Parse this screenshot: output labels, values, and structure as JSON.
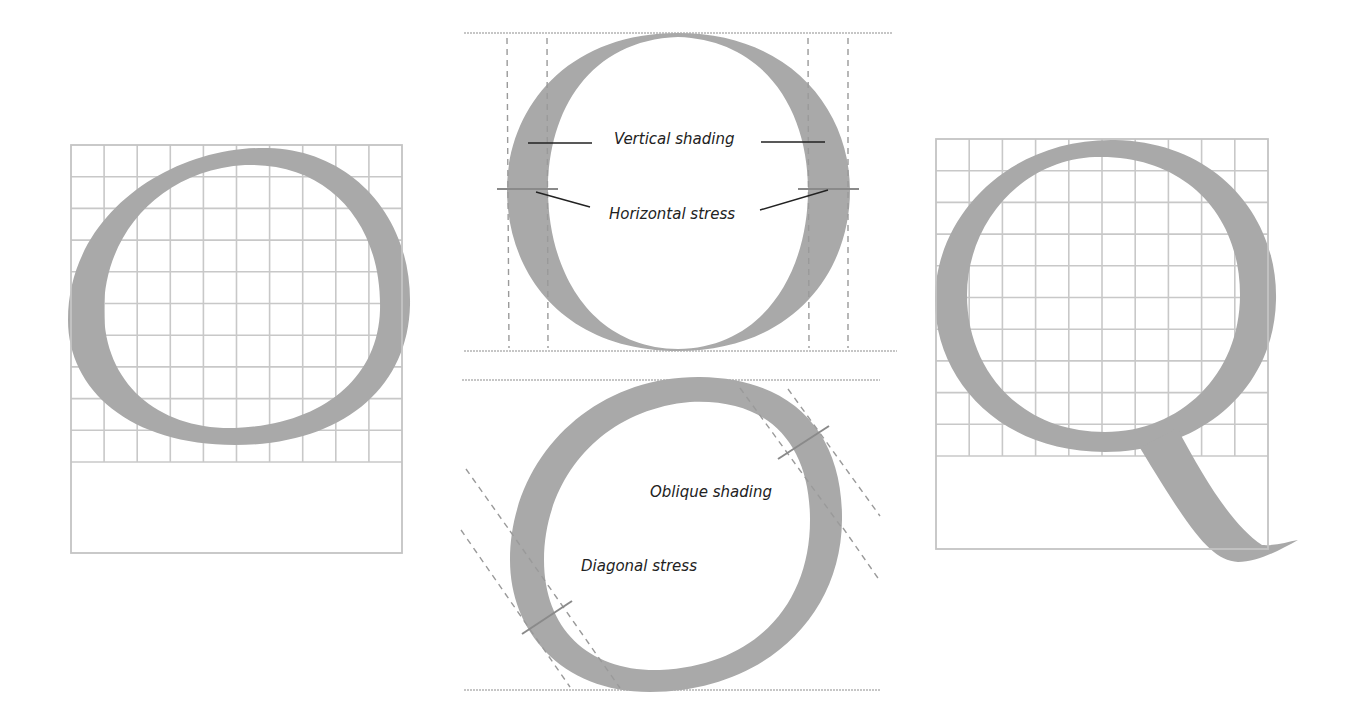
{
  "figure": {
    "panels": [
      {
        "id": "left",
        "letter": "O",
        "description": "Letter O on construction grid",
        "grid_columns": 10,
        "grid_rows": 10
      },
      {
        "id": "center-top",
        "letter": "O",
        "description": "Round letter showing vertical shading and horizontal stress",
        "labels": {
          "vertical_shading": "Vertical shading",
          "horizontal_stress": "Horizontal stress"
        }
      },
      {
        "id": "center-bottom",
        "letter": "O",
        "description": "Round letter showing oblique shading and diagonal stress",
        "labels": {
          "oblique_shading": "Oblique shading",
          "diagonal_stress": "Diagonal stress"
        }
      },
      {
        "id": "right",
        "letter": "Q",
        "description": "Letter Q on construction grid",
        "grid_columns": 10,
        "grid_rows": 10
      }
    ],
    "colors": {
      "letter_fill": "#a9a9a9",
      "grid": "#c8c8c8",
      "text": "#222222"
    }
  }
}
